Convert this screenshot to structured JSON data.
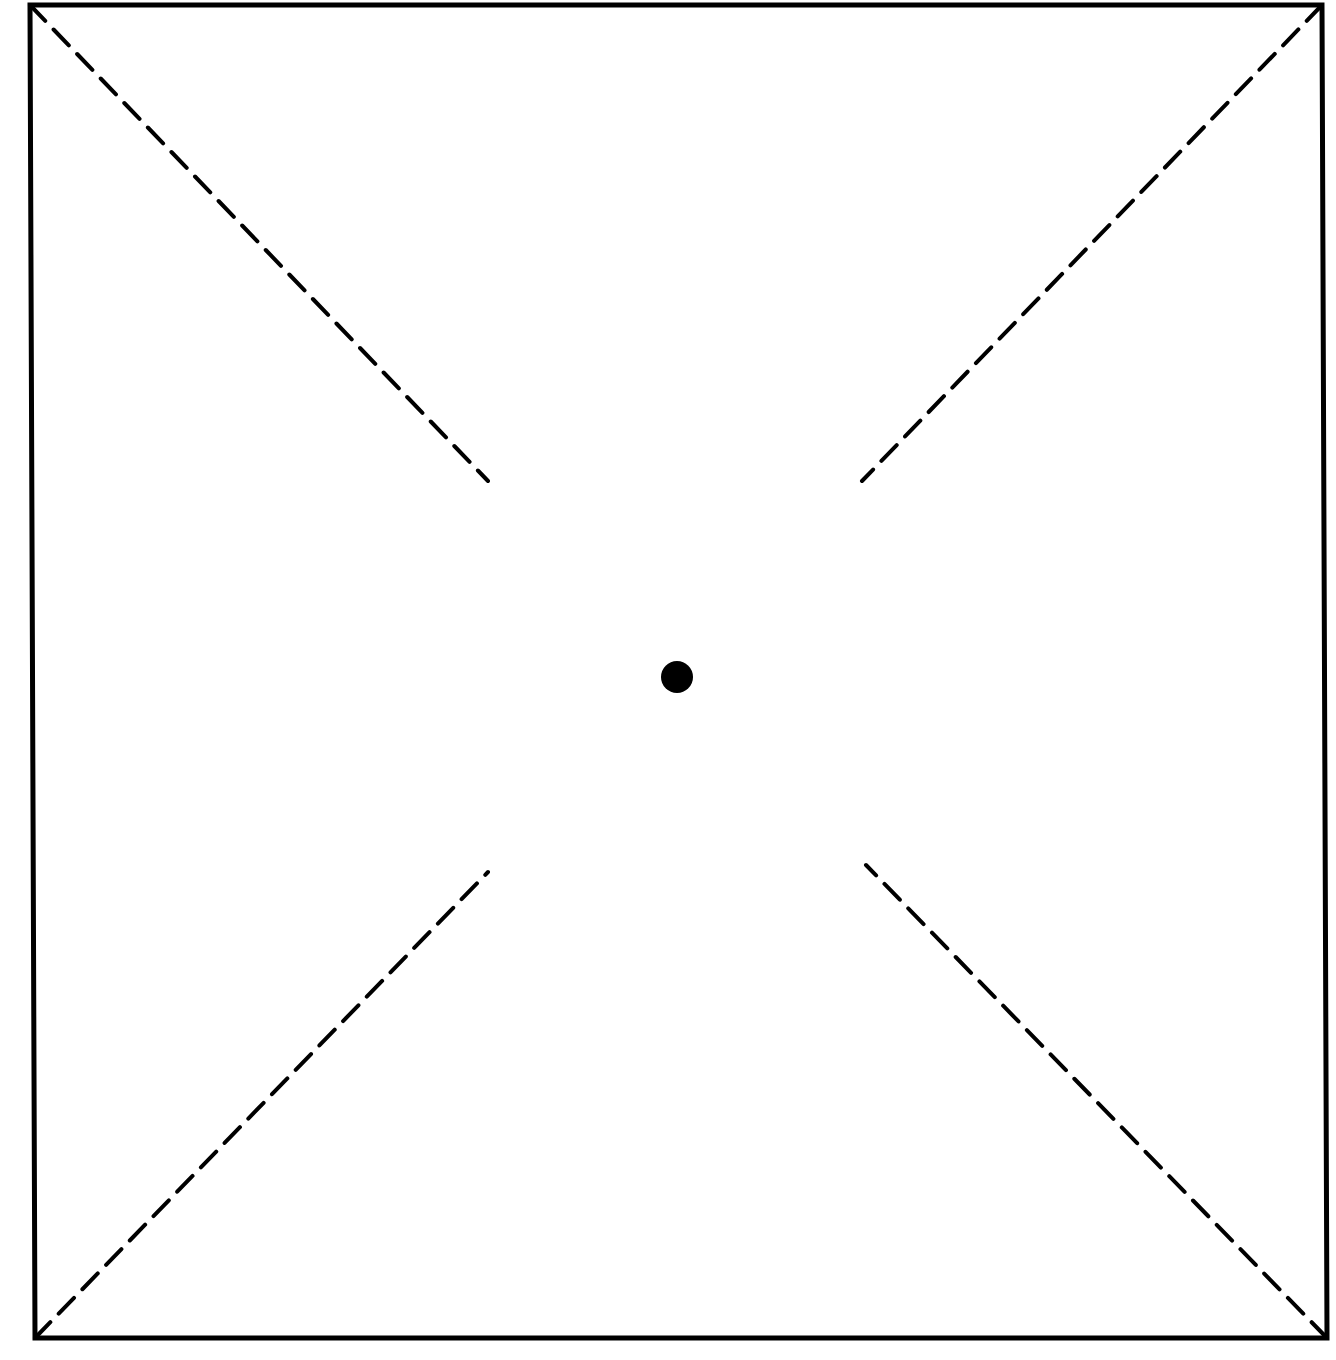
{
  "diagram": {
    "type": "square-with-dashed-diagonals",
    "colors": {
      "stroke": "#000000",
      "background": "#ffffff"
    },
    "square": {
      "corners": {
        "top_left": [
          30,
          5
        ],
        "top_right": [
          1322,
          5
        ],
        "bottom_right": [
          1327,
          1338
        ],
        "bottom_left": [
          35,
          1338
        ]
      },
      "stroke_width": 5
    },
    "center_point": {
      "x": 677,
      "y": 677,
      "radius": 16
    },
    "dashed_segments": [
      {
        "name": "top-left",
        "from": [
          30,
          5
        ],
        "to": [
          488,
          481
        ]
      },
      {
        "name": "top-right",
        "from": [
          1322,
          5
        ],
        "to": [
          862,
          481
        ]
      },
      {
        "name": "bottom-left",
        "from": [
          35,
          1338
        ],
        "to": [
          488,
          872
        ]
      },
      {
        "name": "bottom-right",
        "from": [
          1327,
          1338
        ],
        "to": [
          866,
          865
        ]
      }
    ],
    "dash_pattern": [
      22,
      12
    ],
    "dash_width": 4
  }
}
